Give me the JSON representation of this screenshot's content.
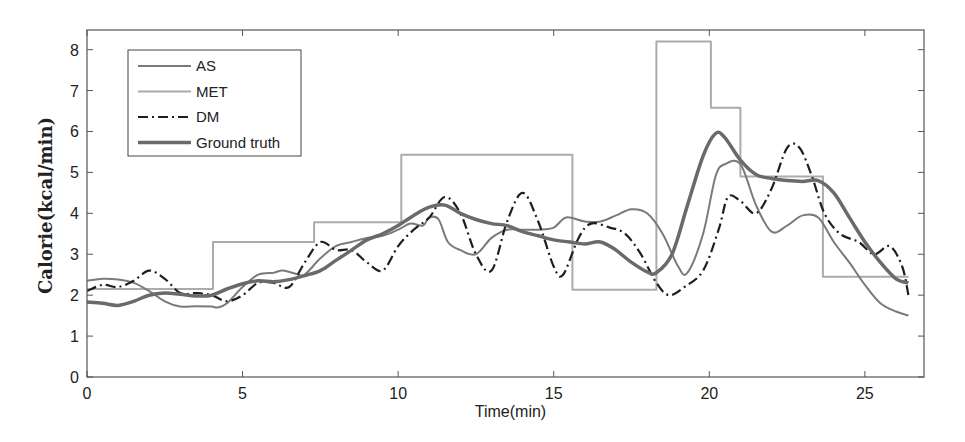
{
  "chart_data": {
    "type": "line",
    "title": "",
    "xlabel": "Time(min)",
    "ylabel": "Calorie(kcal/min)",
    "xlim": [
      0,
      27
    ],
    "ylim": [
      0,
      8.5
    ],
    "xticks": [
      0,
      5,
      10,
      15,
      20,
      25
    ],
    "yticks": [
      0,
      1,
      2,
      3,
      4,
      5,
      6,
      7,
      8
    ],
    "grid": false,
    "legend_position": "upper left",
    "series": [
      {
        "name": "AS",
        "color": "#7a7a7a",
        "width": 2,
        "dash": "",
        "points": [
          [
            0,
            2.35
          ],
          [
            0.5,
            2.4
          ],
          [
            1,
            2.38
          ],
          [
            1.5,
            2.3
          ],
          [
            2,
            2.1
          ],
          [
            2.5,
            1.85
          ],
          [
            3,
            1.72
          ],
          [
            3.5,
            1.73
          ],
          [
            4,
            1.72
          ],
          [
            4.2,
            1.7
          ],
          [
            4.5,
            1.8
          ],
          [
            5,
            2.2
          ],
          [
            5.5,
            2.5
          ],
          [
            6,
            2.55
          ],
          [
            6.3,
            2.6
          ],
          [
            6.8,
            2.5
          ],
          [
            7,
            2.5
          ],
          [
            7.5,
            2.9
          ],
          [
            8,
            3.2
          ],
          [
            8.5,
            3.3
          ],
          [
            9,
            3.4
          ],
          [
            9.5,
            3.45
          ],
          [
            10,
            3.6
          ],
          [
            10.4,
            3.75
          ],
          [
            10.8,
            3.7
          ],
          [
            11,
            3.9
          ],
          [
            11.3,
            3.85
          ],
          [
            11.6,
            3.3
          ],
          [
            12,
            3.1
          ],
          [
            12.5,
            3.0
          ],
          [
            13,
            3.4
          ],
          [
            13.5,
            3.6
          ],
          [
            14,
            3.6
          ],
          [
            14.5,
            3.6
          ],
          [
            15,
            3.65
          ],
          [
            15.4,
            3.9
          ],
          [
            16,
            3.8
          ],
          [
            16.5,
            3.8
          ],
          [
            17,
            3.95
          ],
          [
            17.5,
            4.1
          ],
          [
            18,
            4.0
          ],
          [
            18.5,
            3.5
          ],
          [
            19,
            2.7
          ],
          [
            19.3,
            2.55
          ],
          [
            19.8,
            3.5
          ],
          [
            20.2,
            4.9
          ],
          [
            20.5,
            5.2
          ],
          [
            21,
            5.2
          ],
          [
            21.5,
            4.2
          ],
          [
            22,
            3.55
          ],
          [
            22.5,
            3.7
          ],
          [
            23,
            3.95
          ],
          [
            23.5,
            3.9
          ],
          [
            24,
            3.3
          ],
          [
            24.5,
            2.8
          ],
          [
            25,
            2.25
          ],
          [
            25.5,
            1.8
          ],
          [
            26,
            1.6
          ],
          [
            26.4,
            1.5
          ]
        ]
      },
      {
        "name": "MET",
        "color": "#ababab",
        "width": 2,
        "dash": "",
        "step": true,
        "points": [
          [
            0,
            2.15
          ],
          [
            4.05,
            2.15
          ],
          [
            4.05,
            3.3
          ],
          [
            7.3,
            3.3
          ],
          [
            7.3,
            3.78
          ],
          [
            10.1,
            3.78
          ],
          [
            10.1,
            5.43
          ],
          [
            15.6,
            5.43
          ],
          [
            15.6,
            2.13
          ],
          [
            18.3,
            2.13
          ],
          [
            18.3,
            8.2
          ],
          [
            20.05,
            8.2
          ],
          [
            20.05,
            6.58
          ],
          [
            21.0,
            6.58
          ],
          [
            21.0,
            4.9
          ],
          [
            23.65,
            4.9
          ],
          [
            23.65,
            2.45
          ],
          [
            26.4,
            2.45
          ]
        ]
      },
      {
        "name": "DM",
        "color": "#1e1e1e",
        "width": 2.2,
        "dash": "10,4,2,4",
        "points": [
          [
            0,
            2.1
          ],
          [
            0.5,
            2.25
          ],
          [
            1,
            2.2
          ],
          [
            1.5,
            2.35
          ],
          [
            2,
            2.6
          ],
          [
            2.5,
            2.4
          ],
          [
            3,
            2.05
          ],
          [
            3.5,
            2.05
          ],
          [
            4,
            2.0
          ],
          [
            4.5,
            1.85
          ],
          [
            5,
            2.0
          ],
          [
            5.5,
            2.3
          ],
          [
            6,
            2.3
          ],
          [
            6.5,
            2.2
          ],
          [
            7,
            2.8
          ],
          [
            7.5,
            3.3
          ],
          [
            8,
            3.1
          ],
          [
            8.5,
            3.1
          ],
          [
            9,
            2.8
          ],
          [
            9.5,
            2.6
          ],
          [
            10,
            3.2
          ],
          [
            10.5,
            3.6
          ],
          [
            11,
            3.9
          ],
          [
            11.5,
            4.4
          ],
          [
            12,
            4.0
          ],
          [
            12.5,
            3.0
          ],
          [
            13,
            2.6
          ],
          [
            13.5,
            3.8
          ],
          [
            14,
            4.5
          ],
          [
            14.5,
            3.8
          ],
          [
            15,
            2.7
          ],
          [
            15.3,
            2.5
          ],
          [
            15.8,
            3.4
          ],
          [
            16.2,
            3.75
          ],
          [
            16.8,
            3.65
          ],
          [
            17.3,
            3.5
          ],
          [
            17.8,
            3.0
          ],
          [
            18.3,
            2.3
          ],
          [
            18.7,
            2.0
          ],
          [
            19.2,
            2.2
          ],
          [
            19.8,
            2.6
          ],
          [
            20.3,
            3.6
          ],
          [
            20.6,
            4.4
          ],
          [
            21,
            4.3
          ],
          [
            21.5,
            4.0
          ],
          [
            22,
            4.6
          ],
          [
            22.5,
            5.6
          ],
          [
            22.9,
            5.6
          ],
          [
            23.3,
            4.9
          ],
          [
            23.7,
            4.0
          ],
          [
            24.2,
            3.5
          ],
          [
            24.8,
            3.3
          ],
          [
            25.3,
            3.0
          ],
          [
            25.8,
            3.2
          ],
          [
            26.2,
            2.7
          ],
          [
            26.4,
            2.0
          ]
        ]
      },
      {
        "name": "Ground truth",
        "color": "#6a6a6a",
        "width": 3.5,
        "dash": "",
        "points": [
          [
            0,
            1.83
          ],
          [
            0.5,
            1.8
          ],
          [
            1,
            1.75
          ],
          [
            1.5,
            1.85
          ],
          [
            2,
            2.0
          ],
          [
            2.5,
            2.05
          ],
          [
            3,
            2.02
          ],
          [
            3.5,
            1.98
          ],
          [
            4,
            2.0
          ],
          [
            4.5,
            2.15
          ],
          [
            5,
            2.28
          ],
          [
            5.5,
            2.35
          ],
          [
            6,
            2.33
          ],
          [
            6.5,
            2.38
          ],
          [
            7,
            2.48
          ],
          [
            7.5,
            2.6
          ],
          [
            8,
            2.85
          ],
          [
            8.5,
            3.1
          ],
          [
            9,
            3.35
          ],
          [
            9.5,
            3.5
          ],
          [
            10,
            3.7
          ],
          [
            10.5,
            3.95
          ],
          [
            11,
            4.15
          ],
          [
            11.5,
            4.2
          ],
          [
            12,
            4.0
          ],
          [
            12.5,
            3.85
          ],
          [
            13,
            3.75
          ],
          [
            13.5,
            3.7
          ],
          [
            14,
            3.55
          ],
          [
            14.5,
            3.45
          ],
          [
            15,
            3.35
          ],
          [
            15.5,
            3.3
          ],
          [
            16,
            3.25
          ],
          [
            16.5,
            3.3
          ],
          [
            17,
            3.1
          ],
          [
            17.5,
            2.8
          ],
          [
            18,
            2.57
          ],
          [
            18.3,
            2.55
          ],
          [
            18.8,
            3.0
          ],
          [
            19.3,
            4.2
          ],
          [
            19.8,
            5.4
          ],
          [
            20.2,
            5.95
          ],
          [
            20.5,
            5.85
          ],
          [
            21,
            5.3
          ],
          [
            21.5,
            4.95
          ],
          [
            22,
            4.85
          ],
          [
            22.5,
            4.8
          ],
          [
            23,
            4.78
          ],
          [
            23.5,
            4.8
          ],
          [
            24,
            4.5
          ],
          [
            24.5,
            3.9
          ],
          [
            25,
            3.3
          ],
          [
            25.5,
            2.8
          ],
          [
            26,
            2.4
          ],
          [
            26.4,
            2.3
          ]
        ]
      }
    ]
  },
  "layout": {
    "plot_left": 87,
    "plot_right": 924,
    "plot_top": 30,
    "plot_bottom": 377,
    "x_max_axis": 26.9,
    "y_max_axis": 8.48
  }
}
